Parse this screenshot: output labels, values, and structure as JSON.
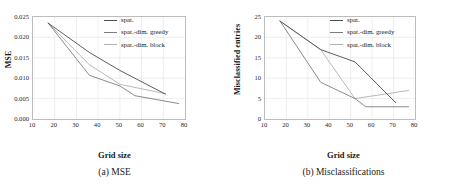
{
  "figure": {
    "panels": [
      {
        "id": "mse",
        "caption": "(a) MSE",
        "xlabel": "Grid size",
        "ylabel": "MSE",
        "chart_data": {
          "type": "line",
          "title": "(a) MSE",
          "xlabel": "Grid size",
          "ylabel": "MSE",
          "xlim": [
            10,
            80
          ],
          "ylim": [
            0.0,
            0.025
          ],
          "xticks": [
            10,
            20,
            30,
            40,
            50,
            60,
            70,
            80
          ],
          "yticks": [
            "0.000",
            "0.005",
            "0.010",
            "0.015",
            "0.020",
            "0.025"
          ],
          "ytick_values": [
            0.0,
            0.005,
            0.01,
            0.015,
            0.02,
            0.025
          ],
          "grid": true,
          "legend_position": "top-right",
          "series": [
            {
              "name": "spat.",
              "color": "#4d4d4d",
              "x": [
                17,
                36,
                50,
                71
              ],
              "values": [
                0.0235,
                0.0163,
                0.0119,
                0.0061
              ]
            },
            {
              "name": "spat.-dim. greedy",
              "color": "#7d7d7d",
              "x": [
                17,
                36,
                50,
                57,
                77
              ],
              "values": [
                0.0235,
                0.0107,
                0.0081,
                0.0057,
                0.0038
              ]
            },
            {
              "name": "spat.-dim. block",
              "color": "#b0b0b0",
              "x": [
                17,
                36,
                50,
                71
              ],
              "values": [
                0.0235,
                0.0133,
                0.0085,
                0.0062
              ]
            }
          ]
        }
      },
      {
        "id": "misclassifications",
        "caption": "(b) Misclassifications",
        "xlabel": "Grid size",
        "ylabel": "Misclassified entries",
        "chart_data": {
          "type": "line",
          "title": "(b) Misclassifications",
          "xlabel": "Grid size",
          "ylabel": "Misclassified entries",
          "xlim": [
            10,
            80
          ],
          "ylim": [
            0,
            25
          ],
          "xticks": [
            10,
            20,
            30,
            40,
            50,
            60,
            70,
            80
          ],
          "yticks": [
            "0",
            "5",
            "10",
            "15",
            "20",
            "25"
          ],
          "ytick_values": [
            0,
            5,
            10,
            15,
            20,
            25
          ],
          "grid": true,
          "legend_position": "top-right",
          "series": [
            {
              "name": "spat.",
              "color": "#4d4d4d",
              "x": [
                17,
                36,
                52,
                71
              ],
              "values": [
                24,
                17,
                14,
                4
              ]
            },
            {
              "name": "spat.-dim. greedy",
              "color": "#7d7d7d",
              "x": [
                17,
                36,
                52,
                57,
                77
              ],
              "values": [
                24,
                9,
                5,
                3,
                3
              ]
            },
            {
              "name": "spat.-dim. block",
              "color": "#b0b0b0",
              "x": [
                17,
                36,
                52,
                77
              ],
              "values": [
                24,
                17,
                5,
                7
              ]
            }
          ]
        }
      }
    ]
  }
}
